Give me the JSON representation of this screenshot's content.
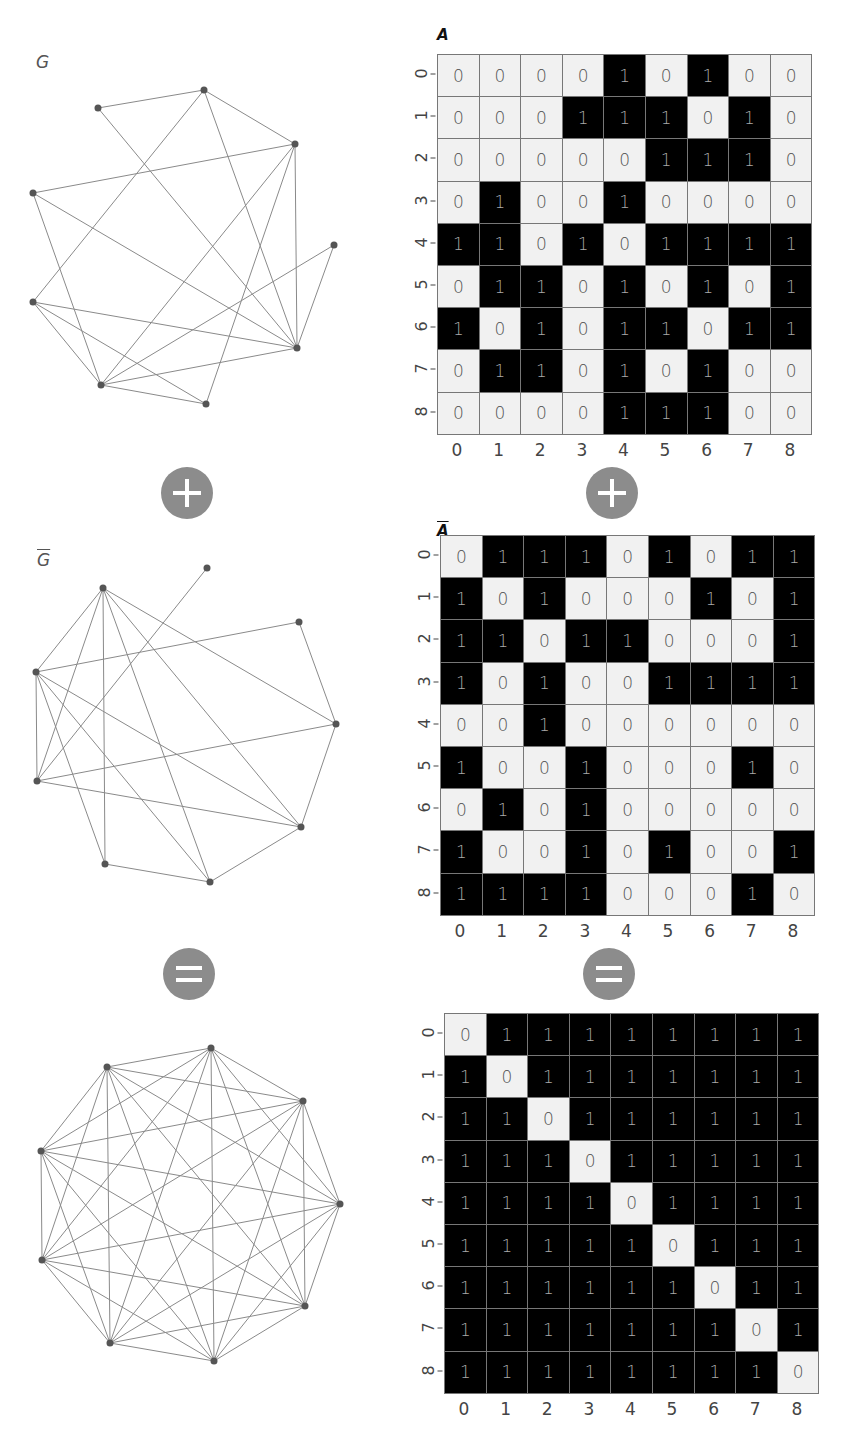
{
  "graphs": [
    {
      "id": "G",
      "label": "G",
      "overbar": false,
      "top": 40,
      "nodes": [
        [
          204,
          90
        ],
        [
          98,
          108
        ],
        [
          295,
          144
        ],
        [
          33,
          193
        ],
        [
          334,
          245
        ],
        [
          33,
          302
        ],
        [
          297,
          348
        ],
        [
          101,
          385
        ],
        [
          206,
          404
        ]
      ],
      "node_map": [
        1,
        3,
        5,
        8,
        0,
        7,
        4,
        6,
        2
      ],
      "matrix_ref": "A"
    },
    {
      "id": "Gbar",
      "label": "G",
      "overbar": true,
      "top": 548,
      "nodes": [
        [
          207,
          568
        ],
        [
          103,
          588
        ],
        [
          299,
          622
        ],
        [
          36,
          672
        ],
        [
          336,
          724
        ],
        [
          37,
          781
        ],
        [
          301,
          827
        ],
        [
          105,
          864
        ],
        [
          210,
          882
        ]
      ],
      "node_map": [
        4,
        0,
        6,
        3,
        1,
        2,
        8,
        5,
        7
      ],
      "matrix_ref": "A_bar"
    },
    {
      "id": "K9",
      "label": "",
      "overbar": false,
      "top": 1040,
      "nodes": [
        [
          211,
          1048
        ],
        [
          107,
          1067
        ],
        [
          303,
          1101
        ],
        [
          41,
          1151
        ],
        [
          340,
          1204
        ],
        [
          42,
          1260
        ],
        [
          305,
          1306
        ],
        [
          110,
          1343
        ],
        [
          214,
          1361
        ]
      ],
      "node_map": [
        0,
        1,
        2,
        3,
        4,
        5,
        6,
        7,
        8
      ],
      "matrix_ref": "K"
    }
  ],
  "operators": [
    {
      "type": "plus",
      "name": "plus-icon",
      "left_graph": [
        187,
        467
      ],
      "left_matrix": [
        588,
        467
      ]
    },
    {
      "type": "equals",
      "name": "equals-icon",
      "left_graph": [
        163,
        948
      ],
      "left_matrix": [
        583,
        948
      ]
    }
  ],
  "matrices": {
    "A": {
      "title": "A",
      "overbar": false,
      "title_pos": [
        437,
        26
      ],
      "grid_pos": [
        437,
        54
      ],
      "values": [
        [
          0,
          0,
          0,
          0,
          1,
          0,
          1,
          0,
          0
        ],
        [
          0,
          0,
          0,
          1,
          1,
          1,
          0,
          1,
          0
        ],
        [
          0,
          0,
          0,
          0,
          0,
          1,
          1,
          1,
          0
        ],
        [
          0,
          1,
          0,
          0,
          1,
          0,
          0,
          0,
          0
        ],
        [
          1,
          1,
          0,
          1,
          0,
          1,
          1,
          1,
          1
        ],
        [
          0,
          1,
          1,
          0,
          1,
          0,
          1,
          0,
          1
        ],
        [
          1,
          0,
          1,
          0,
          1,
          1,
          0,
          1,
          1
        ],
        [
          0,
          1,
          1,
          0,
          1,
          0,
          1,
          0,
          0
        ],
        [
          0,
          0,
          0,
          0,
          1,
          1,
          1,
          0,
          0
        ]
      ]
    },
    "A_bar": {
      "title": "A",
      "overbar": true,
      "title_pos": [
        437,
        522
      ],
      "grid_pos": [
        440,
        535
      ],
      "values": [
        [
          0,
          1,
          1,
          1,
          0,
          1,
          0,
          1,
          1
        ],
        [
          1,
          0,
          1,
          0,
          0,
          0,
          1,
          0,
          1
        ],
        [
          1,
          1,
          0,
          1,
          1,
          0,
          0,
          0,
          1
        ],
        [
          1,
          0,
          1,
          0,
          0,
          1,
          1,
          1,
          1
        ],
        [
          0,
          0,
          1,
          0,
          0,
          0,
          0,
          0,
          0
        ],
        [
          1,
          0,
          0,
          1,
          0,
          0,
          0,
          1,
          0
        ],
        [
          0,
          1,
          0,
          1,
          0,
          0,
          0,
          0,
          0
        ],
        [
          1,
          0,
          0,
          1,
          0,
          1,
          0,
          0,
          1
        ],
        [
          1,
          1,
          1,
          1,
          0,
          0,
          0,
          1,
          0
        ]
      ]
    },
    "K": {
      "title": "",
      "overbar": false,
      "title_pos": [
        437,
        1000
      ],
      "grid_pos": [
        444,
        1013
      ],
      "values": [
        [
          0,
          1,
          1,
          1,
          1,
          1,
          1,
          1,
          1
        ],
        [
          1,
          0,
          1,
          1,
          1,
          1,
          1,
          1,
          1
        ],
        [
          1,
          1,
          0,
          1,
          1,
          1,
          1,
          1,
          1
        ],
        [
          1,
          1,
          1,
          0,
          1,
          1,
          1,
          1,
          1
        ],
        [
          1,
          1,
          1,
          1,
          0,
          1,
          1,
          1,
          1
        ],
        [
          1,
          1,
          1,
          1,
          1,
          0,
          1,
          1,
          1
        ],
        [
          1,
          1,
          1,
          1,
          1,
          1,
          0,
          1,
          1
        ],
        [
          1,
          1,
          1,
          1,
          1,
          1,
          1,
          0,
          1
        ],
        [
          1,
          1,
          1,
          1,
          1,
          1,
          1,
          1,
          0
        ]
      ]
    }
  },
  "axis_ticks": [
    "0",
    "1",
    "2",
    "3",
    "4",
    "5",
    "6",
    "7",
    "8"
  ],
  "colors": {
    "edge": "#8a8a8a",
    "node": "#555555",
    "cell_one": "#000000",
    "cell_zero": "#f1f1f1",
    "operator": "#8c8c8c"
  }
}
